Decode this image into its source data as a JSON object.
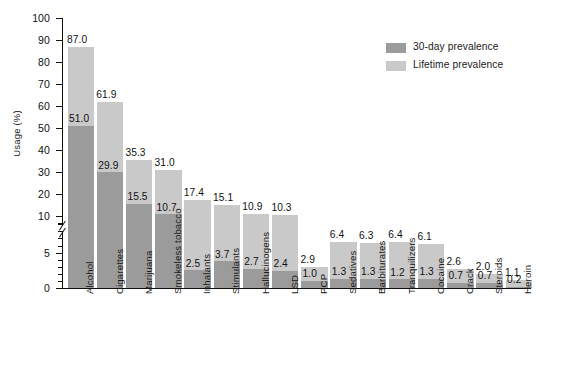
{
  "chart_data": {
    "type": "bar",
    "title": "",
    "xlabel": "",
    "ylabel": "Usage (%)",
    "ylim": [
      0,
      100
    ],
    "axis_break": {
      "between": [
        5,
        10
      ],
      "note": "broken y-axis; 0-10 region expanded"
    },
    "grid": false,
    "legend_position": "top-right",
    "categories": [
      "Alcohol",
      "Cigarettes",
      "Marijuana",
      "Smokeless tobacco",
      "Inhalants",
      "Stimulants",
      "Hallucinogens",
      "LSD",
      "PCP",
      "Sedatives",
      "Barbiturates",
      "Tranquilizers",
      "Cocaine",
      "Crack",
      "Steroids",
      "Heroin"
    ],
    "series": [
      {
        "name": "Lifetime prevalence",
        "color": "#c9c9c9",
        "values": [
          87.0,
          61.9,
          35.3,
          31.0,
          17.4,
          15.1,
          10.9,
          10.3,
          2.9,
          6.4,
          6.3,
          6.4,
          6.1,
          2.6,
          2.0,
          1.1
        ]
      },
      {
        "name": "30-day prevalence",
        "color": "#9b9b9b",
        "values": [
          51.0,
          29.9,
          15.5,
          10.7,
          2.5,
          3.7,
          2.7,
          2.4,
          1.0,
          1.3,
          1.3,
          1.2,
          1.3,
          0.7,
          0.7,
          0.2
        ]
      }
    ],
    "value_labels": {
      "lifetime": [
        "87.0",
        "61.9",
        "35.3",
        "31.0",
        "17.4",
        "15.1",
        "10.9",
        "10.3",
        "2.9",
        "6.4",
        "6.3",
        "6.4",
        "6.1",
        "2.6",
        "2.0",
        "1.1"
      ],
      "thirty_day": [
        "51.0",
        "29.9",
        "15.5",
        "10.7",
        "2.5",
        "3.7",
        "2.7",
        "2.4",
        "1.0",
        "1.3",
        "1.3",
        "1.2",
        "1.3",
        "0.7",
        "0.7",
        "0.2"
      ]
    },
    "yticks": [
      "100",
      "90",
      "80",
      "70",
      "60",
      "50",
      "40",
      "30",
      "20",
      "10",
      "5",
      "0"
    ]
  },
  "legend": {
    "items": [
      {
        "label": "30-day prevalence",
        "color": "#9b9b9b"
      },
      {
        "label": "Lifetime prevalence",
        "color": "#c9c9c9"
      }
    ]
  }
}
